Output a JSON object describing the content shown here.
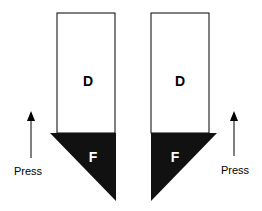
{
  "figure": {
    "left_key": {
      "upper_label": "D",
      "lower_label": "F",
      "arrow_label": "Press"
    },
    "right_key": {
      "upper_label": "D",
      "lower_label": "F",
      "arrow_label": "Press"
    },
    "colors": {
      "outline": "#000000",
      "fill_dark": "#111111",
      "background": "#ffffff"
    }
  }
}
